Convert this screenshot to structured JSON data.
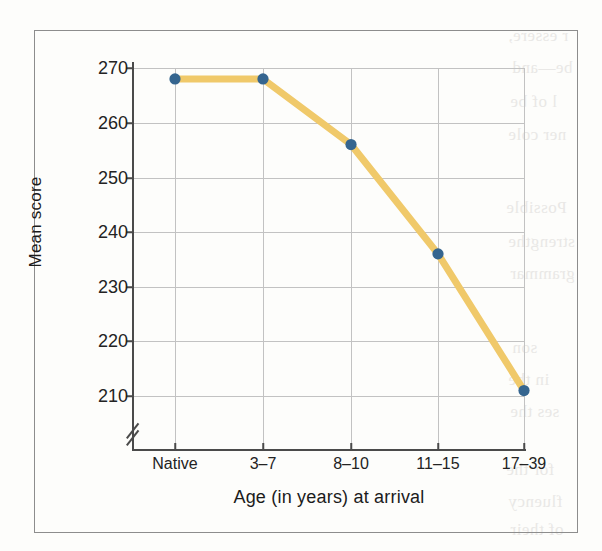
{
  "figure": {
    "caption": "",
    "background_color": "#fdfdfb",
    "frame_color": "#8d8d8d"
  },
  "chart_data": {
    "type": "line",
    "title": "",
    "subtitle": "",
    "xlabel": "Age (in years) at arrival",
    "ylabel": "Mean score",
    "categories": [
      "Native",
      "3–7",
      "8–10",
      "11–15",
      "17–39"
    ],
    "values": [
      268,
      268,
      256,
      236,
      211
    ],
    "series": [
      {
        "name": "Mean score",
        "values": [
          268,
          268,
          256,
          236,
          211
        ],
        "line_color": "#f0c96a",
        "marker_color": "#35658f"
      }
    ],
    "ylim": [
      205,
      270
    ],
    "yticks": [
      270,
      260,
      250,
      240,
      230,
      220,
      210
    ],
    "ytick_labels": [
      "270",
      "260",
      "250",
      "240",
      "230",
      "220",
      "210"
    ],
    "xtick_labels": [
      "Native",
      "3–7",
      "8–10",
      "11–15",
      "17–39"
    ],
    "grid": true,
    "grid_color": "#c2c2c2",
    "legend": false,
    "legend_position": "none",
    "y_axis_break": true,
    "axis_color": "#4a4a4a",
    "annotations": []
  },
  "bleed_text": {
    "right": [
      "r essere,",
      "be—and",
      "l of be",
      "ner cole",
      "Possible",
      "strengthe",
      "grammar",
      "son",
      "in the",
      "ses the",
      "for the",
      "fluency",
      "of their"
    ],
    "left": [
      "",
      ""
    ]
  }
}
